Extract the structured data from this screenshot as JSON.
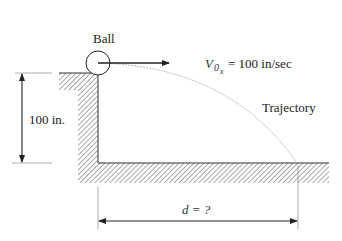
{
  "diagram": {
    "type": "projectile-motion-figure",
    "labels": {
      "ball": "Ball",
      "velocity_symbol": "V",
      "velocity_subscript": "0",
      "velocity_subsubscript": "x",
      "velocity_value": "= 100 in/sec",
      "height": "100 in.",
      "trajectory": "Trajectory",
      "distance": "d = ?"
    },
    "values": {
      "initial_horizontal_velocity": 100,
      "velocity_unit": "in/sec",
      "height": 100,
      "height_unit": "in.",
      "distance": "?"
    },
    "colors": {
      "line": "#222222",
      "hatch": "#666666",
      "trajectory": "#bbbbbb",
      "dimension": "#333333"
    }
  }
}
